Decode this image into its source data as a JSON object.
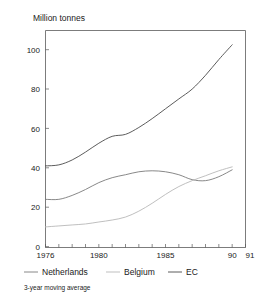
{
  "chart_data": {
    "type": "line",
    "title": "Million tonnes",
    "xlabel": "",
    "ylabel": "Million tonnes",
    "ylim": [
      0,
      110
    ],
    "xlim": [
      1976,
      1991
    ],
    "yticks": [
      0,
      20,
      40,
      60,
      80,
      100
    ],
    "ytick_labels": [
      "0",
      "20",
      "40",
      "60",
      "80",
      "100"
    ],
    "xticks": [
      1976,
      1977,
      1978,
      1979,
      1980,
      1981,
      1982,
      1983,
      1984,
      1985,
      1986,
      1987,
      1988,
      1989,
      1990,
      1991
    ],
    "xtick_labels": [
      "1976",
      "",
      "",
      "",
      "1980",
      "",
      "",
      "",
      "",
      "1985",
      "",
      "",
      "",
      "",
      "90",
      "91"
    ],
    "grid": false,
    "legend_position": "below",
    "annotation": "3-year moving average",
    "x": [
      1976,
      1977,
      1978,
      1979,
      1980,
      1981,
      1982,
      1983,
      1984,
      1985,
      1986,
      1987,
      1988,
      1989,
      1990
    ],
    "series": [
      {
        "name": "EC",
        "color": "#4a4a4a",
        "values": [
          41,
          41.5,
          44,
          48,
          52.5,
          56,
          57,
          60.5,
          65,
          70,
          75,
          80,
          87,
          95,
          102.5
        ]
      },
      {
        "name": "Netherlands",
        "color": "#7a7a7a",
        "values": [
          24,
          24,
          26,
          29,
          32.5,
          35,
          36.5,
          38,
          38.5,
          38,
          36.5,
          34,
          33.5,
          35.5,
          39
        ]
      },
      {
        "name": "Belgium",
        "color": "#b8b8b8",
        "values": [
          10,
          10.5,
          11,
          11.5,
          12.5,
          13.5,
          15,
          18,
          22,
          26.5,
          30.5,
          33.5,
          36,
          38.5,
          40.5
        ]
      }
    ]
  },
  "axis": {
    "title": "Million tonnes",
    "ytick_0": "0",
    "ytick_20": "20",
    "ytick_40": "40",
    "ytick_60": "60",
    "ytick_80": "80",
    "ytick_100": "100",
    "xtick_1976": "1976",
    "xtick_1980": "1980",
    "xtick_1985": "1985",
    "xtick_1990": "90",
    "xtick_1991": "91"
  },
  "legend": {
    "items": [
      {
        "label": "Netherlands",
        "color": "#7a7a7a"
      },
      {
        "label": "Belgium",
        "color": "#b8b8b8"
      },
      {
        "label": "EC",
        "color": "#4a4a4a"
      }
    ]
  },
  "footnote": {
    "text": "3-year moving average"
  }
}
